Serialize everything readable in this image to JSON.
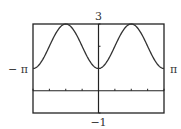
{
  "chart_data": {
    "type": "line",
    "title": "",
    "function": "y = 2 - cos(2x)",
    "xlabel": "",
    "ylabel": "",
    "xlim": [
      -3.14159265,
      3.14159265
    ],
    "ylim": [
      -1,
      3
    ],
    "x_tick_step": 0.785398163,
    "y_tick_step": 1,
    "grid": false,
    "labels": {
      "xmin": "− π",
      "xmax": "π",
      "ymax": "3",
      "ymin": "−1"
    },
    "series": [
      {
        "name": "f(x)",
        "x": [
          -3.1416,
          -2.7489,
          -2.3562,
          -1.9635,
          -1.5708,
          -1.1781,
          -0.7854,
          -0.3927,
          0,
          0.3927,
          0.7854,
          1.1781,
          1.5708,
          1.9635,
          2.3562,
          2.7489,
          3.1416
        ],
        "values": [
          1,
          1.29,
          2,
          2.71,
          3,
          2.71,
          2,
          1.29,
          1,
          1.29,
          2,
          2.71,
          3,
          2.71,
          2,
          1.29,
          1
        ]
      }
    ],
    "colors": {
      "frame": "#222222",
      "curve": "#333333",
      "axis": "#222222"
    }
  }
}
